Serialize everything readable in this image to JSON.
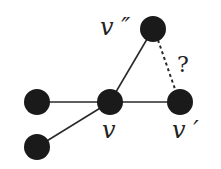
{
  "diagram": {
    "type": "graph",
    "nodes": [
      {
        "id": "v",
        "label": "v",
        "x": 110,
        "y": 102
      },
      {
        "id": "v_prime",
        "label": "v ′",
        "x": 180,
        "y": 102
      },
      {
        "id": "v_double_prime",
        "label": "v ″",
        "x": 153,
        "y": 29
      },
      {
        "id": "left",
        "label": "",
        "x": 37,
        "y": 102
      },
      {
        "id": "bottom_left",
        "label": "",
        "x": 37,
        "y": 147
      }
    ],
    "edges": [
      {
        "from": "left",
        "to": "v",
        "style": "solid"
      },
      {
        "from": "bottom_left",
        "to": "v",
        "style": "solid"
      },
      {
        "from": "v",
        "to": "v_prime",
        "style": "solid"
      },
      {
        "from": "v",
        "to": "v_double_prime",
        "style": "solid"
      },
      {
        "from": "v_double_prime",
        "to": "v_prime",
        "style": "dotted",
        "label": "?"
      }
    ],
    "labels": {
      "v": "v",
      "v_prime": "v ′",
      "v_double_prime": "v ″",
      "question": "?"
    },
    "colors": {
      "node": "#1a1a1a",
      "edge": "#2a2a2a"
    }
  }
}
